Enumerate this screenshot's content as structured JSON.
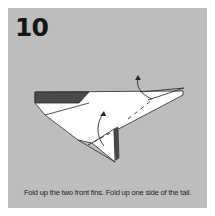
{
  "step": {
    "number": "10",
    "caption": "Fold up the two front fins. Fold up one side of the tail."
  },
  "colors": {
    "panel_background": "#bdbdbd",
    "paper": "#ffffff",
    "paper_dark_side": "#4a4a4a",
    "lines": "#2a2a2a",
    "text": "#1e1e1e"
  },
  "diagram": {
    "arrows": [
      "fold-up-front-fin-arrow",
      "fold-up-tail-arrow"
    ]
  }
}
